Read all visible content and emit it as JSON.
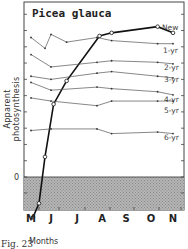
{
  "chart_data": {
    "type": "line",
    "title": "Picea glauca",
    "xlabel": "Months",
    "ylabel": "Apparent photosynthesis",
    "caption": "Fig. 23",
    "x_ticks": [
      "M",
      "J",
      "J",
      "A",
      "S",
      "O",
      "N"
    ],
    "y_tick_labels": [
      "0"
    ],
    "ylim_units": [
      -3,
      12.5
    ],
    "grid": false,
    "shaded_region": "below zero",
    "series": [
      {
        "name": "New",
        "marker": "open-circle",
        "weight": "bold",
        "points": [
          [
            0.1,
            -2.6
          ],
          [
            0.4,
            -1.7
          ],
          [
            0.7,
            1.3
          ],
          [
            1.1,
            4.7
          ],
          [
            1.6,
            6.2
          ],
          [
            2.9,
            9.1
          ],
          [
            3.4,
            9.3
          ],
          [
            5.3,
            9.7
          ],
          [
            6.1,
            9.3
          ]
        ]
      },
      {
        "name": "1-yr",
        "marker": "dot",
        "points": [
          [
            0.0,
            9.0
          ],
          [
            0.7,
            8.3
          ],
          [
            1.0,
            9.2
          ],
          [
            1.6,
            8.7
          ],
          [
            2.8,
            9.0
          ],
          [
            3.4,
            8.8
          ],
          [
            5.3,
            8.6
          ],
          [
            6.0,
            8.6
          ]
        ]
      },
      {
        "name": "2-yr",
        "marker": "dot",
        "points": [
          [
            0.0,
            7.9
          ],
          [
            1.0,
            7.1
          ],
          [
            2.8,
            7.4
          ],
          [
            3.4,
            7.5
          ],
          [
            5.3,
            7.4
          ],
          [
            6.0,
            7.3
          ]
        ]
      },
      {
        "name": "3-yr",
        "marker": "dot",
        "points": [
          [
            0.0,
            6.5
          ],
          [
            1.0,
            6.3
          ],
          [
            2.8,
            6.7
          ],
          [
            3.4,
            6.8
          ],
          [
            5.3,
            6.5
          ],
          [
            6.0,
            6.4
          ]
        ]
      },
      {
        "name": "4-yr",
        "marker": "dot",
        "points": [
          [
            0.0,
            6.1
          ],
          [
            1.0,
            5.6
          ],
          [
            2.8,
            5.8
          ],
          [
            3.4,
            5.7
          ],
          [
            5.3,
            5.5
          ],
          [
            6.0,
            5.3
          ]
        ]
      },
      {
        "name": "5-yr",
        "marker": "dot",
        "points": [
          [
            0.0,
            5.1
          ],
          [
            1.0,
            4.9
          ],
          [
            2.8,
            4.6
          ],
          [
            3.4,
            4.9
          ],
          [
            5.3,
            4.9
          ],
          [
            6.0,
            4.9
          ]
        ]
      },
      {
        "name": "6-yr",
        "marker": "dot",
        "points": [
          [
            0.0,
            3.0
          ],
          [
            1.0,
            3.1
          ],
          [
            2.8,
            3.1
          ],
          [
            3.4,
            2.8
          ],
          [
            5.3,
            2.9
          ],
          [
            6.0,
            2.8
          ]
        ]
      }
    ]
  }
}
